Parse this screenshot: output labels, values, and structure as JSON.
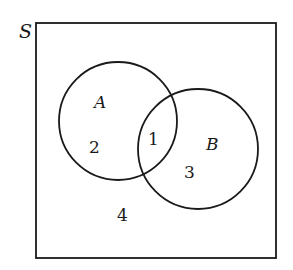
{
  "diagram": {
    "type": "venn",
    "universe": {
      "label": "S",
      "x": 36,
      "y": 23,
      "width": 240,
      "height": 235
    },
    "sets": [
      {
        "id": "A",
        "label": "A",
        "cx": 118,
        "cy": 121,
        "r": 59,
        "label_x": 94,
        "label_y": 108
      },
      {
        "id": "B",
        "label": "B",
        "cx": 198,
        "cy": 149,
        "r": 60,
        "label_x": 206,
        "label_y": 150
      }
    ],
    "regions": [
      {
        "id": "A_only",
        "label": "2",
        "x": 89,
        "y": 153
      },
      {
        "id": "A_and_B",
        "label": "1",
        "x": 148,
        "y": 145
      },
      {
        "id": "B_only",
        "label": "3",
        "x": 184,
        "y": 178
      },
      {
        "id": "outside",
        "label": "4",
        "x": 117,
        "y": 221
      }
    ],
    "colors": {
      "stroke": "#1a1a1a",
      "background": "#ffffff"
    }
  }
}
